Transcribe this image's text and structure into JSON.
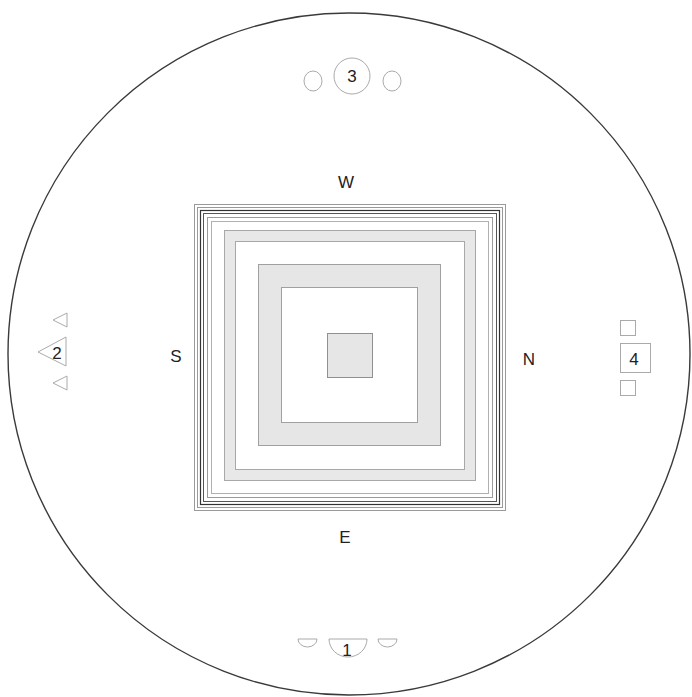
{
  "diagram": {
    "type": "layout plan",
    "directions": {
      "west": "W",
      "east": "E",
      "south": "S",
      "north": "N"
    },
    "markers": [
      {
        "id": "marker-1",
        "label": "1",
        "shape": "semicircle",
        "position": "bottom"
      },
      {
        "id": "marker-2",
        "label": "2",
        "shape": "triangle",
        "position": "left"
      },
      {
        "id": "marker-3",
        "label": "3",
        "shape": "circle",
        "position": "top"
      },
      {
        "id": "marker-4",
        "label": "4",
        "shape": "square",
        "position": "right"
      }
    ],
    "colors": {
      "outline": "#333333",
      "light_line": "#aaaaaa",
      "fill_gray": "#e6e6e6",
      "background": "#ffffff"
    }
  }
}
